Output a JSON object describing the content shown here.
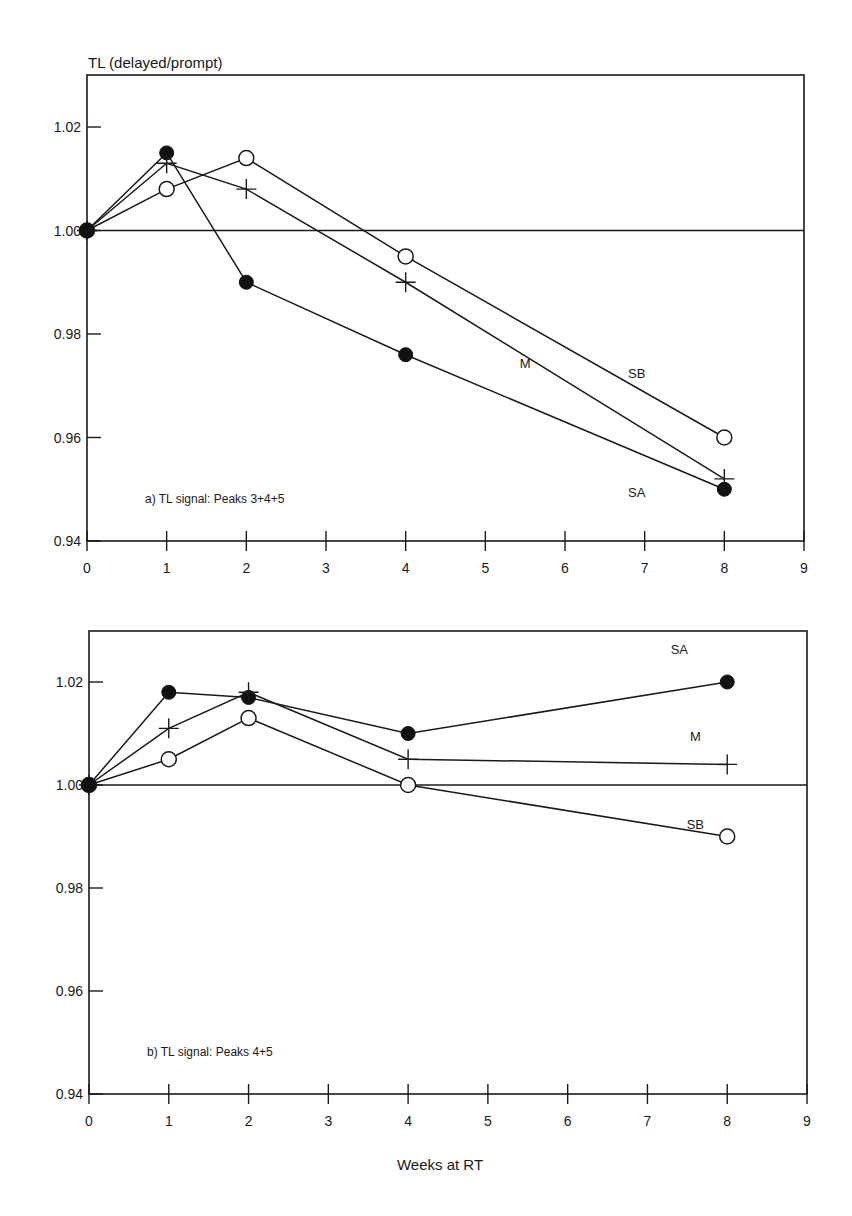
{
  "figure": {
    "ylabel": "TL (delayed/prompt)",
    "xlabel": "Weeks at RT"
  },
  "chart_data": [
    {
      "type": "line",
      "panel": "a",
      "title": "a) TL signal: Peaks 3+4+5",
      "xlabel": "Weeks at RT",
      "ylabel": "TL (delayed/prompt)",
      "xlim": [
        0,
        9
      ],
      "ylim": [
        0.94,
        1.03
      ],
      "x_ticks": [
        0,
        1,
        2,
        3,
        4,
        5,
        6,
        7,
        8,
        9
      ],
      "y_ticks": [
        0.94,
        0.96,
        0.98,
        1.0,
        1.02
      ],
      "y_tick_labels": [
        "0.94",
        "0.96",
        "0.98",
        "1.00",
        "1.02"
      ],
      "reference_line": 1.0,
      "grid": false,
      "x": [
        0,
        1,
        2,
        4,
        8
      ],
      "series": [
        {
          "name": "SA",
          "marker": "filled-circle",
          "values": [
            1.0,
            1.015,
            0.99,
            0.976,
            0.95
          ]
        },
        {
          "name": "M",
          "marker": "plus",
          "values": [
            1.0,
            1.013,
            1.008,
            0.99,
            0.952
          ]
        },
        {
          "name": "SB",
          "marker": "open-circle",
          "values": [
            1.0,
            1.008,
            1.014,
            0.995,
            0.96
          ]
        }
      ],
      "annotations": [
        {
          "text": "SB",
          "x": 6.9,
          "y": 0.9715
        },
        {
          "text": "M",
          "x": 5.5,
          "y": 0.9735
        },
        {
          "text": "SA",
          "x": 6.9,
          "y": 0.9485
        }
      ]
    },
    {
      "type": "line",
      "panel": "b",
      "title": "b) TL signal: Peaks 4+5",
      "xlabel": "Weeks at RT",
      "ylabel": "TL (delayed/prompt)",
      "xlim": [
        0,
        9
      ],
      "ylim": [
        0.94,
        1.03
      ],
      "x_ticks": [
        0,
        1,
        2,
        3,
        4,
        5,
        6,
        7,
        8,
        9
      ],
      "y_ticks": [
        0.94,
        0.96,
        0.98,
        1.0,
        1.02
      ],
      "y_tick_labels": [
        "0.94",
        "0.96",
        "0.98",
        "1.00",
        "1.02"
      ],
      "reference_line": 1.0,
      "grid": false,
      "x": [
        0,
        1,
        2,
        4,
        8
      ],
      "series": [
        {
          "name": "SA",
          "marker": "filled-circle",
          "values": [
            1.0,
            1.018,
            1.017,
            1.01,
            1.02
          ]
        },
        {
          "name": "M",
          "marker": "plus",
          "values": [
            1.0,
            1.011,
            1.018,
            1.005,
            1.004
          ]
        },
        {
          "name": "SB",
          "marker": "open-circle",
          "values": [
            1.0,
            1.005,
            1.013,
            1.0,
            0.99
          ]
        }
      ],
      "annotations": [
        {
          "text": "SA",
          "x": 7.4,
          "y": 1.0255
        },
        {
          "text": "M",
          "x": 7.6,
          "y": 1.0085
        },
        {
          "text": "SB",
          "x": 7.6,
          "y": 0.9915
        }
      ]
    }
  ]
}
